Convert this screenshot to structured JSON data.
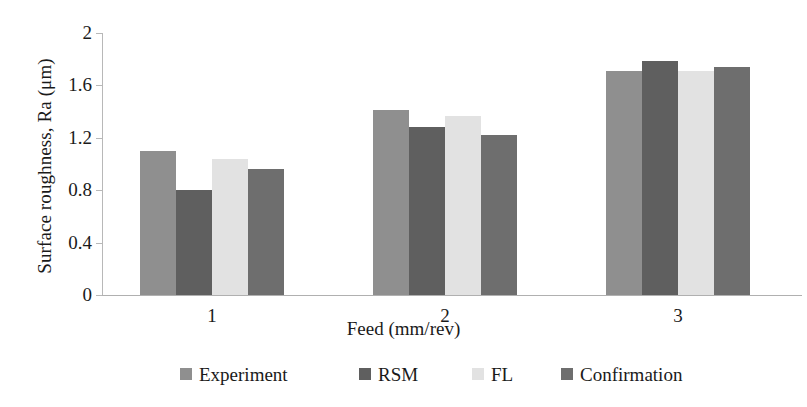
{
  "chart_data": {
    "type": "bar",
    "title": "",
    "subtitle": "",
    "xlabel": "Feed (mm/rev)",
    "ylabel": "Surface roughness, Ra (μm)",
    "categories": [
      "1",
      "2",
      "3"
    ],
    "ylim": [
      0,
      2
    ],
    "yticks": [
      0,
      0.4,
      0.8,
      1.2,
      1.6,
      2
    ],
    "ytick_labels": [
      "0",
      "0.4",
      "0.8",
      "1.2",
      "1.6",
      "2"
    ],
    "grid": false,
    "legend_position": "bottom",
    "series": [
      {
        "name": "Experiment",
        "color": "#8f8f8f",
        "values": [
          1.1,
          1.41,
          1.71
        ]
      },
      {
        "name": "RSM",
        "color": "#5f5f5f",
        "values": [
          0.8,
          1.28,
          1.79
        ]
      },
      {
        "name": "FL",
        "color": "#e2e2e2",
        "values": [
          1.04,
          1.37,
          1.71
        ]
      },
      {
        "name": "Confirmation",
        "color": "#6e6e6e",
        "values": [
          0.96,
          1.22,
          1.74
        ]
      }
    ]
  },
  "legend": {
    "items": [
      {
        "label": "Experiment",
        "color": "#8f8f8f"
      },
      {
        "label": "RSM",
        "color": "#5f5f5f"
      },
      {
        "label": "FL",
        "color": "#e2e2e2"
      },
      {
        "label": "Confirmation",
        "color": "#6e6e6e"
      }
    ]
  },
  "axes": {
    "y_title": "Surface roughness, Ra (μm)",
    "x_title": "Feed (mm/rev)"
  }
}
